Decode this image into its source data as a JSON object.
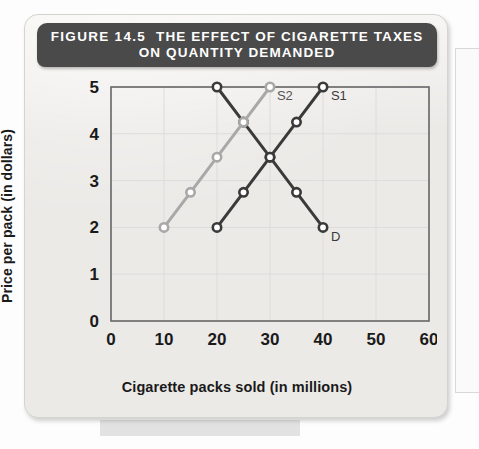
{
  "figure": {
    "number": "FIGURE 14.5",
    "title_line1": "THE EFFECT OF CIGARETTE TAXES",
    "title_line2": "ON QUANTITY DEMANDED"
  },
  "colors": {
    "header_bg": "#4a4a4a",
    "card_bg": "#eceae7",
    "demand_dark": "#3a3a3a",
    "supply_s1_dark": "#3a3a3a",
    "supply_s2_light": "#a8a8a8",
    "axis": "#666666",
    "grid": "#dcdcdc"
  },
  "chart_data": {
    "type": "line",
    "title": "THE EFFECT OF CIGARETTE TAXES ON QUANTITY DEMANDED",
    "xlabel": "Cigarette packs sold (in millions)",
    "ylabel": "Price per pack (in dollars)",
    "xlim": [
      0,
      60
    ],
    "ylim": [
      0,
      5
    ],
    "xticks": [
      0,
      10,
      20,
      30,
      40,
      50,
      60
    ],
    "yticks": [
      0,
      1,
      2,
      3,
      4,
      5
    ],
    "grid": true,
    "legend_position": "inline-end-labels",
    "series": [
      {
        "name": "D",
        "label": "D",
        "color": "#3a3a3a",
        "label_x": 41.5,
        "label_y": 1.72,
        "points": [
          {
            "x": 20,
            "y": 5.0
          },
          {
            "x": 25,
            "y": 4.25
          },
          {
            "x": 30,
            "y": 3.5
          },
          {
            "x": 35,
            "y": 2.75
          },
          {
            "x": 40,
            "y": 2.0
          }
        ]
      },
      {
        "name": "S1",
        "label": "S1",
        "color": "#3a3a3a",
        "label_x": 41.5,
        "label_y": 4.72,
        "points": [
          {
            "x": 20,
            "y": 2.0
          },
          {
            "x": 25,
            "y": 2.75
          },
          {
            "x": 30,
            "y": 3.5
          },
          {
            "x": 35,
            "y": 4.25
          },
          {
            "x": 40,
            "y": 5.0
          }
        ]
      },
      {
        "name": "S2",
        "label": "S2",
        "color": "#a8a8a8",
        "label_x": 31.3,
        "label_y": 4.72,
        "points": [
          {
            "x": 10,
            "y": 2.0
          },
          {
            "x": 15,
            "y": 2.75
          },
          {
            "x": 20,
            "y": 3.5
          },
          {
            "x": 25,
            "y": 4.25
          },
          {
            "x": 30,
            "y": 5.0
          }
        ]
      }
    ],
    "annotations": [
      {
        "text": "D",
        "x": 41.5,
        "y": 1.72
      },
      {
        "text": "S1",
        "x": 41.5,
        "y": 4.72
      },
      {
        "text": "S2",
        "x": 31.3,
        "y": 4.72
      }
    ]
  }
}
